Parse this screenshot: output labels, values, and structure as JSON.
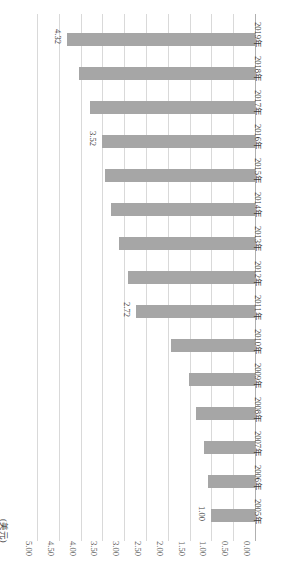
{
  "chart_data": {
    "type": "bar",
    "orientation": "horizontal",
    "title": "",
    "subtitle": "",
    "xlabel": "",
    "ylabel": "(美元)",
    "unit_label": "(美元)",
    "categories": [
      "2005年",
      "2006年",
      "2007年",
      "2008年",
      "2009年",
      "2010年",
      "2011年",
      "2012年",
      "2013年",
      "2014年",
      "2015年",
      "2016年",
      "2017年",
      "2018年",
      "2019年"
    ],
    "values": [
      1.0,
      1.08,
      1.18,
      1.36,
      1.52,
      1.93,
      2.72,
      2.92,
      3.13,
      3.3,
      3.44,
      3.52,
      3.79,
      4.04,
      4.32
    ],
    "series": [
      {
        "name": "",
        "values": [
          1.0,
          1.08,
          1.18,
          1.36,
          1.52,
          1.93,
          2.72,
          2.92,
          3.13,
          3.3,
          3.44,
          3.52,
          3.79,
          4.04,
          4.32
        ]
      }
    ],
    "data_labels": [
      {
        "category": "2005年",
        "value": 1.0,
        "text": "1.00"
      },
      {
        "category": "2011年",
        "value": 2.72,
        "text": "2.72"
      },
      {
        "category": "2016年",
        "value": 3.52,
        "text": "3.52"
      },
      {
        "category": "2019年",
        "value": 4.32,
        "text": "4.32"
      }
    ],
    "axis_ticks": [
      "5.00",
      "4.50",
      "4.00",
      "3.50",
      "3.00",
      "2.50",
      "2.00",
      "1.50",
      "1.00",
      "0.50",
      "0.00"
    ],
    "axis_tick_values": [
      5.0,
      4.5,
      4.0,
      3.5,
      3.0,
      2.5,
      2.0,
      1.5,
      1.0,
      0.5,
      0.0
    ],
    "xlim": [
      0,
      5
    ],
    "ylim": [
      0,
      5
    ],
    "grid": true,
    "legend": false,
    "legend_position": "none",
    "colors": {
      "bar": "#a6a6a6",
      "gridline": "#d9d9d9",
      "axis": "#b0b0b0",
      "text": "#3b3b3b",
      "tick_text": "#595959",
      "background": "#ffffff"
    }
  }
}
